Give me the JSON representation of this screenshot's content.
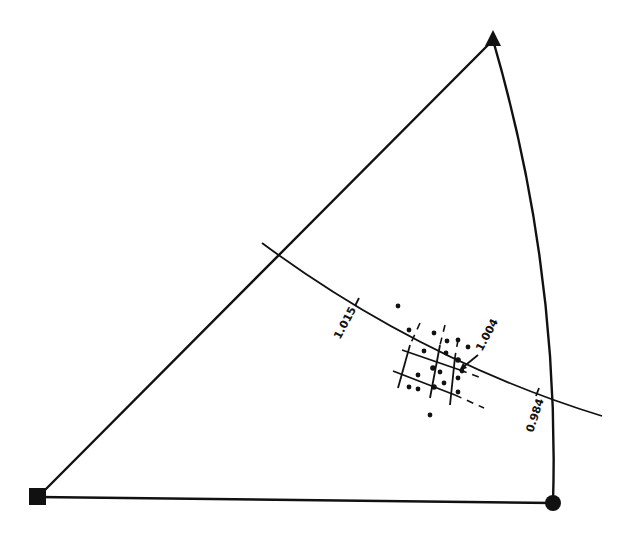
{
  "figure": {
    "type": "ternary-sector-diagram",
    "vertices": {
      "top": {
        "marker": "filled-triangle",
        "x": 493,
        "y": 38
      },
      "bottom_left": {
        "marker": "filled-square",
        "x": 38,
        "y": 497
      },
      "bottom_right": {
        "marker": "filled-circle",
        "x": 553,
        "y": 503
      }
    },
    "contour": {
      "labels": {
        "left": "1.015",
        "center": "1.004",
        "right": "0.984"
      }
    },
    "data_point_count": 24
  }
}
